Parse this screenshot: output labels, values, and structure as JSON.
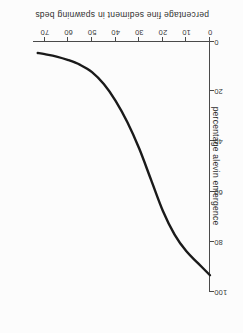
{
  "chart_data": {
    "type": "line",
    "title": "",
    "xlabel": "percentage fine sediment in spawning beds",
    "ylabel": "percentage alevin emergence",
    "xlim": [
      0,
      75
    ],
    "ylim": [
      0,
      105
    ],
    "xticks": [
      0,
      10,
      20,
      30,
      40,
      50,
      60,
      70
    ],
    "xticklabels": [
      "0",
      "10",
      "20",
      "30",
      "40",
      "50",
      "60",
      "70"
    ],
    "yticks": [
      0,
      20,
      40,
      60,
      80,
      100
    ],
    "yticklabels": [
      "0",
      "20",
      "40",
      "60",
      "80",
      "100"
    ],
    "grid": false,
    "legend": null,
    "series": [
      {
        "name": "alevin emergence",
        "x": [
          0,
          5,
          10,
          15,
          20,
          25,
          30,
          35,
          40,
          45,
          50,
          55,
          60,
          65,
          70,
          73
        ],
        "values": [
          98,
          93,
          88,
          81,
          71,
          58,
          45,
          34,
          25,
          18,
          13,
          10,
          8,
          6.5,
          5.5,
          5
        ]
      }
    ],
    "annotations": []
  },
  "axis": {
    "x_title": "percentage fine sediment in spawning beds",
    "y_title": "percentage alevin emergence",
    "x_ticks": [
      {
        "label": "0",
        "value": 0
      },
      {
        "label": "10",
        "value": 10
      },
      {
        "label": "20",
        "value": 20
      },
      {
        "label": "30",
        "value": 30
      },
      {
        "label": "40",
        "value": 40
      },
      {
        "label": "50",
        "value": 50
      },
      {
        "label": "60",
        "value": 60
      },
      {
        "label": "70",
        "value": 70
      }
    ],
    "y_ticks": [
      {
        "label": "0",
        "value": 0
      },
      {
        "label": "20",
        "value": 20
      },
      {
        "label": "40",
        "value": 40
      },
      {
        "label": "60",
        "value": 60
      },
      {
        "label": "80",
        "value": 80
      },
      {
        "label": "100",
        "value": 100
      }
    ]
  },
  "style": {
    "background": "#fcfcfc",
    "curve_color": "#1a1a1a",
    "axis_color": "#4a4a4a",
    "text_color": "#2e2e2e"
  }
}
